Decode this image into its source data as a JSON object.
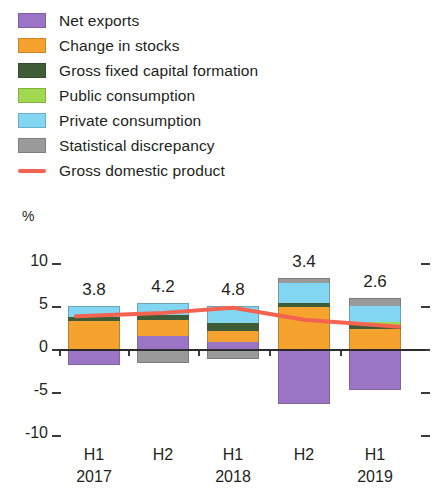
{
  "legend": {
    "items": [
      {
        "label": "Net exports",
        "color": "#9b74c6",
        "type": "swatch",
        "icon": "legend-swatch-net-exports"
      },
      {
        "label": "Change in stocks",
        "color": "#f6a22e",
        "type": "swatch",
        "icon": "legend-swatch-change-in-stocks"
      },
      {
        "label": "Gross fixed capital formation",
        "color": "#3e5c36",
        "type": "swatch",
        "icon": "legend-swatch-gross-fixed-capital-formation"
      },
      {
        "label": "Public consumption",
        "color": "#a0d94f",
        "type": "swatch",
        "icon": "legend-swatch-public-consumption"
      },
      {
        "label": "Private consumption",
        "color": "#82d6f2",
        "type": "swatch",
        "icon": "legend-swatch-private-consumption"
      },
      {
        "label": "Statistical discrepancy",
        "color": "#9a9a9a",
        "type": "swatch",
        "icon": "legend-swatch-statistical-discrepancy"
      },
      {
        "label": "Gross domestic product",
        "color": "#f4634f",
        "type": "line",
        "icon": "legend-line-gross-domestic-product"
      }
    ]
  },
  "axis": {
    "unit": "%",
    "yticks": [
      "10",
      "5",
      "0",
      "-5",
      "-10"
    ],
    "ylim": [
      -10,
      10
    ],
    "xlabels": [
      "H1",
      "H2",
      "H1",
      "H2",
      "H1"
    ],
    "xyears": [
      "2017",
      "",
      "2018",
      "",
      "2019"
    ]
  },
  "chart_data": {
    "type": "bar",
    "title": "",
    "subtitle": "",
    "xlabel": "",
    "ylabel": "%",
    "ylim": [
      -10,
      10
    ],
    "grid": false,
    "stacked": true,
    "legend_position": "top-left",
    "categories": [
      "H1 2017",
      "H2 2017",
      "H1 2018",
      "H2 2018",
      "H1 2019"
    ],
    "series": [
      {
        "name": "Net exports",
        "color": "#9b74c6",
        "values": [
          -1.9,
          0.0,
          0.0,
          -6.4,
          -4.8
        ]
      },
      {
        "name": "Net exports (positive)",
        "color": "#9b74c6",
        "values": [
          0.0,
          1.5,
          0.8,
          0.0,
          0.0
        ]
      },
      {
        "name": "Change in stocks",
        "color": "#f6a22e",
        "values": [
          3.2,
          1.9,
          1.3,
          4.9,
          2.3
        ]
      },
      {
        "name": "Gross fixed capital formation",
        "color": "#3e5c36",
        "values": [
          0.5,
          0.5,
          0.9,
          0.5,
          0.5
        ]
      },
      {
        "name": "Public consumption",
        "color": "#a0d94f",
        "values": [
          0.0,
          0.0,
          0.0,
          0.0,
          0.3
        ]
      },
      {
        "name": "Private consumption",
        "color": "#82d6f2",
        "values": [
          1.3,
          1.4,
          2.0,
          2.3,
          1.9
        ]
      },
      {
        "name": "Statistical discrepancy",
        "color": "#9a9a9a",
        "values": [
          0.0,
          -1.6,
          -1.2,
          0.6,
          0.9
        ]
      }
    ],
    "line_series": {
      "name": "Gross domestic product",
      "color": "#f4634f",
      "values": [
        3.8,
        4.2,
        4.8,
        3.4,
        2.6
      ],
      "labels": [
        "3.8",
        "4.2",
        "4.8",
        "3.4",
        "2.6"
      ]
    }
  }
}
